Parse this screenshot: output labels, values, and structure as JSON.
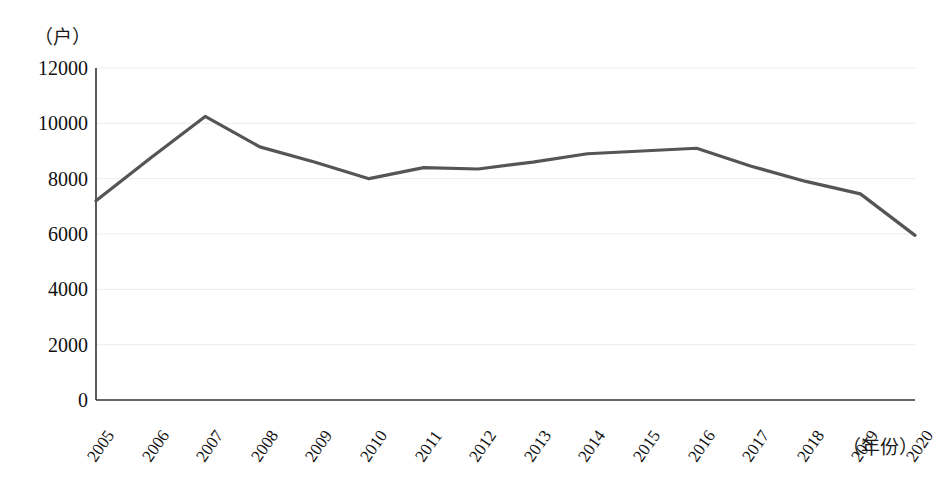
{
  "chart_data": {
    "type": "line",
    "title": "",
    "subtitle": "",
    "xlabel": "（年份）",
    "ylabel": "（户）",
    "categories": [
      "2005",
      "2006",
      "2007",
      "2008",
      "2009",
      "2010",
      "2011",
      "2012",
      "2013",
      "2014",
      "2015",
      "2016",
      "2017",
      "2018",
      "2019",
      "2020"
    ],
    "values": [
      7200,
      8750,
      10250,
      9150,
      8600,
      8000,
      8400,
      8350,
      8600,
      8900,
      9000,
      9100,
      8450,
      7900,
      7450,
      5950
    ],
    "series": [
      {
        "name": "",
        "values": [
          7200,
          8750,
          10250,
          9150,
          8600,
          8000,
          8400,
          8350,
          8600,
          8900,
          9000,
          9100,
          8450,
          7900,
          7450,
          5950
        ]
      }
    ],
    "ylim": [
      0,
      12000
    ],
    "yticks": [
      0,
      2000,
      4000,
      6000,
      8000,
      10000,
      12000
    ],
    "ytick_labels": [
      "0",
      "2000",
      "4000",
      "6000",
      "8000",
      "10000",
      "12000"
    ],
    "xtick_labels": [
      "2005",
      "2006",
      "2007",
      "2008",
      "2009",
      "2010",
      "2011",
      "2012",
      "2013",
      "2014",
      "2015",
      "2016",
      "2017",
      "2018",
      "2019",
      "2020"
    ],
    "grid": true,
    "grid_color": "#ececec",
    "legend": false,
    "legend_position": "none",
    "line_color": "#555555",
    "axis_color": "#333333",
    "background": "#ffffff",
    "annotations": []
  },
  "axis_labels": {
    "y_unit": "（户）",
    "x_unit": "（年份）"
  }
}
